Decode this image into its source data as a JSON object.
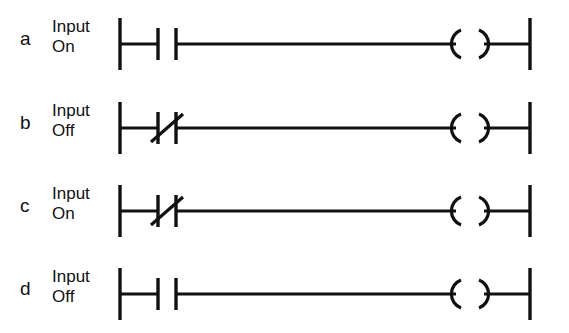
{
  "diagram": {
    "background_color": "#ffffff",
    "line_color": "#111111",
    "rails": {
      "left_x": 120,
      "right_x": 530
    },
    "rungs": [
      {
        "letter": "a",
        "input_name": "Input",
        "input_state": "On",
        "contact_type": "normally-open",
        "contact_symbol": "-| |-",
        "coil_symbol": "-( )-",
        "output_element": "coil"
      },
      {
        "letter": "b",
        "input_name": "Input",
        "input_state": "Off",
        "contact_type": "normally-closed",
        "contact_symbol": "-|/|-",
        "coil_symbol": "-( )-",
        "output_element": "coil"
      },
      {
        "letter": "c",
        "input_name": "Input",
        "input_state": "On",
        "contact_type": "normally-closed",
        "contact_symbol": "-|/|-",
        "coil_symbol": "-( )-",
        "output_element": "coil"
      },
      {
        "letter": "d",
        "input_name": "Input",
        "input_state": "Off",
        "contact_type": "normally-open",
        "contact_symbol": "-| |-",
        "coil_symbol": "-( )-",
        "output_element": "coil"
      }
    ]
  }
}
